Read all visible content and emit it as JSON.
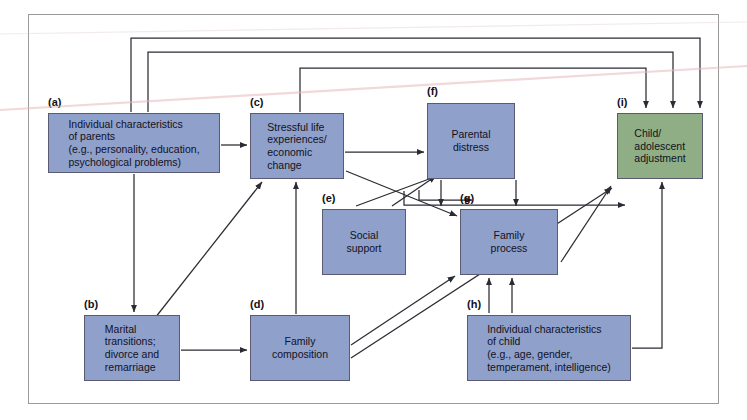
{
  "diagram": {
    "type": "path-diagram",
    "colors": {
      "node_blue": "#8fa0cb",
      "node_green": "#8fae86",
      "node_border": "#5a5a72",
      "wire": "#2b2b33",
      "frame": "#9a9a9a",
      "background": "#ffffff"
    },
    "nodes": [
      {
        "id": "a",
        "tag": "(a)",
        "label": "Individual characteristics\nof parents\n(e.g., personality, education,\npsychological problems)",
        "color": "blue",
        "x": 48,
        "y": 113,
        "w": 172,
        "h": 60,
        "align": "left"
      },
      {
        "id": "b",
        "tag": "(b)",
        "label": "Marital\ntransitions;\ndivorce and\nremarriage",
        "color": "blue",
        "x": 84,
        "y": 315,
        "w": 96,
        "h": 66,
        "align": "left"
      },
      {
        "id": "c",
        "tag": "(c)",
        "label": "Stressful life\nexperiences/\neconomic\nchange",
        "color": "blue",
        "x": 250,
        "y": 113,
        "w": 94,
        "h": 66,
        "align": "left"
      },
      {
        "id": "d",
        "tag": "(d)",
        "label": "Family\ncomposition",
        "color": "blue",
        "x": 250,
        "y": 315,
        "w": 100,
        "h": 66,
        "align": "center"
      },
      {
        "id": "e",
        "tag": "(e)",
        "label": "Social\nsupport",
        "color": "blue",
        "x": 322,
        "y": 209,
        "w": 84,
        "h": 66,
        "align": "center"
      },
      {
        "id": "f",
        "tag": "(f)",
        "label": "Parental\ndistress",
        "color": "blue",
        "x": 427,
        "y": 103,
        "w": 88,
        "h": 76,
        "align": "center"
      },
      {
        "id": "g",
        "tag": "(g)",
        "label": "Family\nprocess",
        "color": "blue",
        "x": 460,
        "y": 209,
        "w": 98,
        "h": 66,
        "align": "center"
      },
      {
        "id": "h",
        "tag": "(h)",
        "label": "Individual characteristics\nof child\n(e.g., age, gender,\ntemperament, intelligence)",
        "color": "blue",
        "x": 467,
        "y": 315,
        "w": 164,
        "h": 66,
        "align": "left"
      },
      {
        "id": "i",
        "tag": "(i)",
        "label": "Child/\nadolescent\nadjustment",
        "color": "green",
        "x": 617,
        "y": 113,
        "w": 86,
        "h": 66,
        "align": "left"
      }
    ],
    "edges": [
      {
        "from": "a",
        "to": "c",
        "style": "straight-horizontal"
      },
      {
        "from": "a",
        "to": "b",
        "style": "straight-vertical"
      },
      {
        "from": "b",
        "to": "d",
        "style": "straight-horizontal"
      },
      {
        "from": "b",
        "to": "c",
        "style": "diagonal"
      },
      {
        "from": "d",
        "to": "c",
        "style": "straight-vertical"
      },
      {
        "from": "d",
        "to": "g",
        "style": "diagonal"
      },
      {
        "from": "d",
        "to": "i",
        "style": "diagonal"
      },
      {
        "from": "c",
        "to": "f",
        "style": "straight-horizontal"
      },
      {
        "from": "c",
        "to": "g",
        "style": "diagonal"
      },
      {
        "from": "c",
        "to": "i",
        "style": "elbow-over-top"
      },
      {
        "from": "a",
        "to": "i",
        "style": "elbow-over-top"
      },
      {
        "from": "e",
        "to": "f",
        "style": "diagonal"
      },
      {
        "from": "e",
        "to": "g",
        "style": "diagonal"
      },
      {
        "from": "f",
        "to": "g",
        "style": "elbow"
      },
      {
        "from": "f",
        "to": "i",
        "style": "elbow-over-top"
      },
      {
        "from": "g",
        "to": "i",
        "style": "diagonal"
      },
      {
        "from": "h",
        "to": "g",
        "style": "straight-vertical"
      },
      {
        "from": "h",
        "to": "i",
        "style": "elbow"
      },
      {
        "from": "h",
        "to": "f",
        "style": "straight-vertical"
      }
    ]
  }
}
